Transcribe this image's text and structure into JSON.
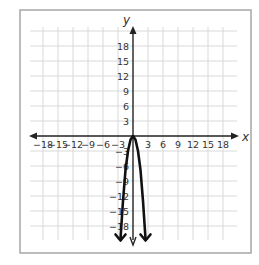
{
  "chart_data": {
    "type": "line",
    "title": "",
    "xlabel": "x",
    "ylabel": "y",
    "xlim": [
      -21,
      21
    ],
    "ylim": [
      -21,
      21
    ],
    "grid": true,
    "grid_step": 3,
    "x_ticks": [
      -18,
      -15,
      -12,
      -9,
      -6,
      -3,
      3,
      6,
      9,
      12,
      15,
      18
    ],
    "x_tick_labels": [
      "−18",
      "−15",
      "−12",
      "−9",
      "−6",
      "−3",
      "3",
      "6",
      "9",
      "12",
      "15",
      "18"
    ],
    "y_ticks": [
      18,
      15,
      12,
      9,
      6,
      3,
      -3,
      -6,
      -9,
      -12,
      -15,
      -18
    ],
    "y_tick_labels": [
      "18",
      "15",
      "12",
      "9",
      "6",
      "3",
      "−3",
      "−6",
      "−9",
      "−12",
      "−15",
      "−18"
    ],
    "series": [
      {
        "name": "parabola",
        "description": "Downward-opening parabola with vertex at the origin, approx y = -3x^2",
        "vertex": [
          0,
          0
        ],
        "points": [
          [
            -2.5,
            -20.5
          ],
          [
            -2,
            -13
          ],
          [
            -1.5,
            -6.8
          ],
          [
            -1,
            -3
          ],
          [
            -0.5,
            -0.75
          ],
          [
            0,
            0
          ],
          [
            0.5,
            -0.75
          ],
          [
            1,
            -3
          ],
          [
            1.5,
            -6.8
          ],
          [
            2,
            -13
          ],
          [
            2.5,
            -20.5
          ]
        ],
        "arrows_at_ends": true
      }
    ],
    "legend": null
  },
  "labels": {
    "x_axis": "x",
    "y_axis": "y"
  },
  "colors": {
    "grid": "#d9d9d9",
    "axis": "#222222",
    "curve": "#111111",
    "frame": "#a6a6a6",
    "text": "#333333"
  }
}
